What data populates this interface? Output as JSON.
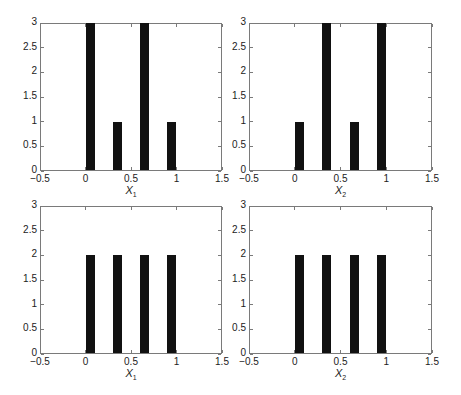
{
  "figure": {
    "layout": "2x2 grid of histograms"
  },
  "panels": [
    {
      "id": "top-left",
      "xlabel_base": "X",
      "xlabel_sub": "1"
    },
    {
      "id": "top-right",
      "xlabel_base": "X",
      "xlabel_sub": "2"
    },
    {
      "id": "bottom-left",
      "xlabel_base": "X",
      "xlabel_sub": "1"
    },
    {
      "id": "bottom-right",
      "xlabel_base": "X",
      "xlabel_sub": "2"
    }
  ],
  "chart_data": [
    {
      "type": "bar",
      "title": "",
      "xlabel": "X1",
      "ylabel": "",
      "xlim": [
        -0.5,
        1.5
      ],
      "ylim": [
        0,
        3
      ],
      "xticks": [
        "-0.5",
        "0",
        "0.5",
        "1",
        "1.5"
      ],
      "yticks": [
        "0",
        "0.5",
        "1",
        "1.5",
        "2",
        "2.5",
        "3"
      ],
      "grid": false,
      "bins": [
        [
          0,
          0.1
        ],
        [
          0.3,
          0.4
        ],
        [
          0.6,
          0.7
        ],
        [
          0.9,
          1.0
        ]
      ],
      "categories": [
        "0.05",
        "0.35",
        "0.65",
        "0.95"
      ],
      "values": [
        3,
        1,
        3,
        1
      ]
    },
    {
      "type": "bar",
      "title": "",
      "xlabel": "X2",
      "ylabel": "",
      "xlim": [
        -0.5,
        1.5
      ],
      "ylim": [
        0,
        3
      ],
      "xticks": [
        "-0.5",
        "0",
        "0.5",
        "1",
        "1.5"
      ],
      "yticks": [
        "0",
        "0.5",
        "1",
        "1.5",
        "2",
        "2.5",
        "3"
      ],
      "grid": false,
      "bins": [
        [
          0,
          0.1
        ],
        [
          0.3,
          0.4
        ],
        [
          0.6,
          0.7
        ],
        [
          0.9,
          1.0
        ]
      ],
      "categories": [
        "0.05",
        "0.35",
        "0.65",
        "0.95"
      ],
      "values": [
        1,
        3,
        1,
        3
      ]
    },
    {
      "type": "bar",
      "title": "",
      "xlabel": "X1",
      "ylabel": "",
      "xlim": [
        -0.5,
        1.5
      ],
      "ylim": [
        0,
        3
      ],
      "xticks": [
        "-0.5",
        "0",
        "0.5",
        "1",
        "1.5"
      ],
      "yticks": [
        "0",
        "0.5",
        "1",
        "1.5",
        "2",
        "2.5",
        "3"
      ],
      "grid": false,
      "bins": [
        [
          0,
          0.1
        ],
        [
          0.3,
          0.4
        ],
        [
          0.6,
          0.7
        ],
        [
          0.9,
          1.0
        ]
      ],
      "categories": [
        "0.05",
        "0.35",
        "0.65",
        "0.95"
      ],
      "values": [
        2,
        2,
        2,
        2
      ]
    },
    {
      "type": "bar",
      "title": "",
      "xlabel": "X2",
      "ylabel": "",
      "xlim": [
        -0.5,
        1.5
      ],
      "ylim": [
        0,
        3
      ],
      "xticks": [
        "-0.5",
        "0",
        "0.5",
        "1",
        "1.5"
      ],
      "yticks": [
        "0",
        "0.5",
        "1",
        "1.5",
        "2",
        "2.5",
        "3"
      ],
      "grid": false,
      "bins": [
        [
          0,
          0.1
        ],
        [
          0.3,
          0.4
        ],
        [
          0.6,
          0.7
        ],
        [
          0.9,
          1.0
        ]
      ],
      "categories": [
        "0.05",
        "0.35",
        "0.65",
        "0.95"
      ],
      "values": [
        2,
        2,
        2,
        2
      ]
    }
  ]
}
